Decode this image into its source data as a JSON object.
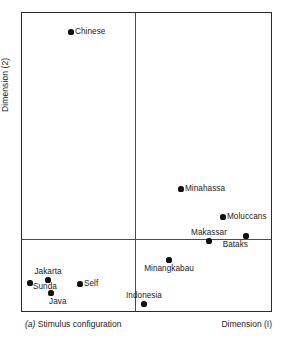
{
  "figure": {
    "caption_marker": "(a)",
    "caption_text": "Stimulus configuration",
    "xlabel": "Dimension (I)",
    "ylabel": "Dimension (2)"
  },
  "chart_data": {
    "type": "scatter",
    "title": "Stimulus configuration",
    "xlabel": "Dimension (I)",
    "ylabel": "Dimension (2)",
    "xlim": [
      -1,
      1
    ],
    "ylim": [
      -1,
      1
    ],
    "grid": false,
    "legend": "none",
    "axes_origin_px": {
      "x": 134,
      "y": 238
    },
    "frame_px": {
      "left": 21,
      "top": 12,
      "right": 272,
      "bottom": 312
    },
    "points": [
      {
        "label": "Chinese",
        "px": 70,
        "py": 31,
        "x": -0.57,
        "y": 0.92,
        "label_pos": "right"
      },
      {
        "label": "Minahassa",
        "px": 180,
        "py": 188,
        "x": 0.41,
        "y": 0.33,
        "label_pos": "right"
      },
      {
        "label": "Moluccans",
        "px": 222,
        "py": 216,
        "x": 0.78,
        "y": 0.15,
        "label_pos": "right"
      },
      {
        "label": "Makassar",
        "px": 208,
        "py": 240,
        "x": 0.65,
        "y": -0.01,
        "label_pos": "above"
      },
      {
        "label": "Bataks",
        "px": 245,
        "py": 235,
        "x": 0.98,
        "y": 0.02,
        "label_pos": "below-left"
      },
      {
        "label": "Minangkabau",
        "px": 168,
        "py": 259,
        "x": 0.3,
        "y": -0.14,
        "label_pos": "below"
      },
      {
        "label": "Indonesia",
        "px": 143,
        "py": 303,
        "x": 0.08,
        "y": -0.43,
        "label_pos": "above"
      },
      {
        "label": "Jakarta",
        "px": 47,
        "py": 279,
        "x": -0.77,
        "y": -0.27,
        "label_pos": "above"
      },
      {
        "label": "Sunda",
        "px": 29,
        "py": 282,
        "x": -0.93,
        "y": -0.29,
        "label_pos": "right-below"
      },
      {
        "label": "Java",
        "px": 50,
        "py": 292,
        "x": -0.74,
        "y": -0.36,
        "label_pos": "below-right"
      },
      {
        "label": "Self",
        "px": 79,
        "py": 283,
        "x": -0.49,
        "y": -0.3,
        "label_pos": "right"
      }
    ]
  }
}
